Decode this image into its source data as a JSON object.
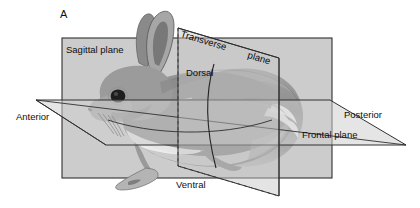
{
  "figure": {
    "panel_letter": "A"
  },
  "labels": {
    "sagittal_plane": "Sagittal plane",
    "transverse_word": "Transverse",
    "plane_word": "plane",
    "frontal_plane": "Frontal plane",
    "dorsal": "Dorsal",
    "ventral": "Ventral",
    "anterior": "Anterior",
    "posterior": "Posterior"
  },
  "colors": {
    "background": "#ffffff",
    "plane_fill": "#c3c3c3",
    "plane_fill_light": "#d2d2d2",
    "frontal_fill": "#cfcfcf",
    "outline": "#2b2b2b",
    "text": "#0f0f0f",
    "body_mid": "#8f8f8f",
    "body_dark": "#6d6d6d",
    "body_light": "#b4b4b4",
    "body_highlight": "#f0f0f0",
    "ear_inner": "#7a7a7a",
    "eye": "#1b1b1b"
  },
  "geometry": {
    "sagittal_rect": {
      "x": 62,
      "y": 38,
      "width": 270,
      "height": 140
    },
    "frontal_left_vertex": [
      36,
      100
    ],
    "frontal_right_vertex": [
      406,
      145
    ],
    "transverse_top_left": [
      178,
      28
    ],
    "transverse_top_right": [
      279,
      58
    ],
    "transverse_bottom": 196
  }
}
